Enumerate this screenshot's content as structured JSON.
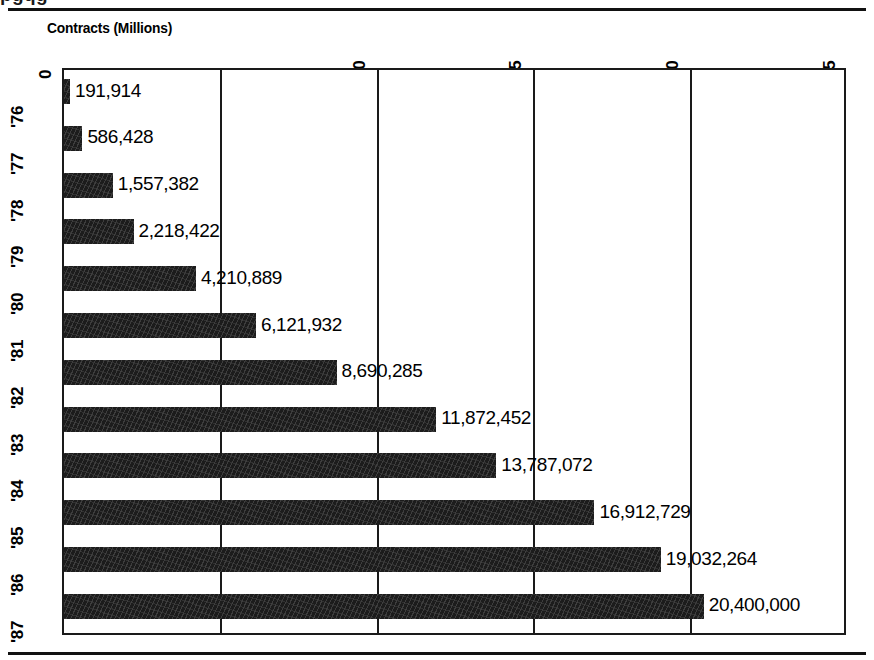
{
  "figure": {
    "cropped_headline_fragment": "pgqg",
    "axis_title": "Contracts (Millions)"
  },
  "chart_data": {
    "type": "bar",
    "orientation": "horizontal",
    "title": "Contracts (Millions)",
    "xlabel": "Contracts (Millions)",
    "ylabel": "",
    "xlim": [
      0,
      25
    ],
    "xticks": [
      0,
      5,
      10,
      15,
      20,
      25
    ],
    "xtick_labels": [
      "0",
      "5",
      "10",
      "15",
      "20",
      "25"
    ],
    "grid": true,
    "grid_axis": "x",
    "legend": false,
    "bar_color": "#1c1c1c",
    "value_unit": "contracts",
    "tick_label_rotation": -90,
    "categories": [
      "'76",
      "'77",
      "'78",
      "'79",
      "'80",
      "'81",
      "'82",
      "'83",
      "'84",
      "'85",
      "'86",
      "'87"
    ],
    "values": [
      191914,
      586428,
      1557382,
      2218422,
      4210889,
      6121932,
      8690285,
      11872452,
      13787072,
      16912729,
      19032264,
      20400000
    ],
    "value_labels": [
      "191,914",
      "586,428",
      "1,557,382",
      "2,218,422",
      "4,210,889",
      "6,121,932",
      "8,690,285",
      "11,872,452",
      "13,787,072",
      "16,912,729",
      "19,032,264",
      "20,400,000"
    ],
    "points": [
      {
        "category": "'76",
        "value": 191914,
        "label": "191,914"
      },
      {
        "category": "'77",
        "value": 586428,
        "label": "586,428"
      },
      {
        "category": "'78",
        "value": 1557382,
        "label": "1,557,382"
      },
      {
        "category": "'79",
        "value": 2218422,
        "label": "2,218,422"
      },
      {
        "category": "'80",
        "value": 4210889,
        "label": "4,210,889"
      },
      {
        "category": "'81",
        "value": 6121932,
        "label": "6,121,932"
      },
      {
        "category": "'82",
        "value": 8690285,
        "label": "8,690,285"
      },
      {
        "category": "'83",
        "value": 11872452,
        "label": "11,872,452"
      },
      {
        "category": "'84",
        "value": 13787072,
        "label": "13,787,072"
      },
      {
        "category": "'85",
        "value": 16912729,
        "label": "16,912,729"
      },
      {
        "category": "'86",
        "value": 19032264,
        "label": "19,032,264"
      },
      {
        "category": "'87",
        "value": 20400000,
        "label": "20,400,000"
      }
    ]
  }
}
